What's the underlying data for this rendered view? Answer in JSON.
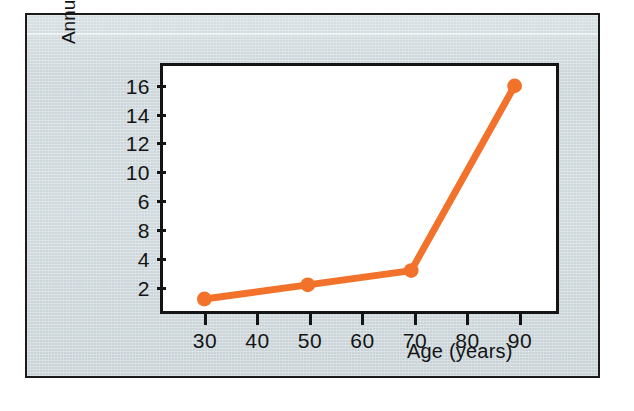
{
  "figure": {
    "background_color": "#ced8dc",
    "plot_background_color": "#ffffff",
    "border_color": "#141414"
  },
  "axes": {
    "y_title": "Annual bed day occupancy\nper person",
    "x_title": "Age (years)"
  },
  "chart_data": {
    "type": "line",
    "title": "",
    "subtitle": "",
    "xlabel": "Age (years)",
    "ylabel": "Annual bed day occupancy per person",
    "x": [
      30,
      50,
      70,
      90
    ],
    "values": [
      1,
      2,
      3,
      16
    ],
    "series": [
      {
        "name": "Annual bed day occupancy per person",
        "color": "#f2722b",
        "x": [
          30,
          50,
          70,
          90
        ],
        "values": [
          1,
          2,
          3,
          16
        ]
      }
    ],
    "xlim": [
      22,
      98
    ],
    "ylim": [
      0,
      17.4
    ],
    "x_tick_values": [
      30,
      40,
      50,
      60,
      70,
      80,
      90
    ],
    "x_tick_labels": [
      "30",
      "40",
      "50",
      "60",
      "70",
      "80",
      "90"
    ],
    "y_tick_positions": [
      16,
      14,
      12,
      10,
      8,
      6,
      4,
      2
    ],
    "y_tick_labels": [
      "16",
      "14",
      "12",
      "10",
      "6",
      "8",
      "4",
      "2"
    ],
    "grid": false,
    "legend": "none",
    "marker": "circle",
    "line_color": "#f2722b",
    "marker_color": "#f2722b",
    "note": "Printed y-axis labels read 16, 14, 12, 10, 6, 8, 4, 2 top-to-bottom; the 6 and 8 are transposed in the original figure."
  }
}
